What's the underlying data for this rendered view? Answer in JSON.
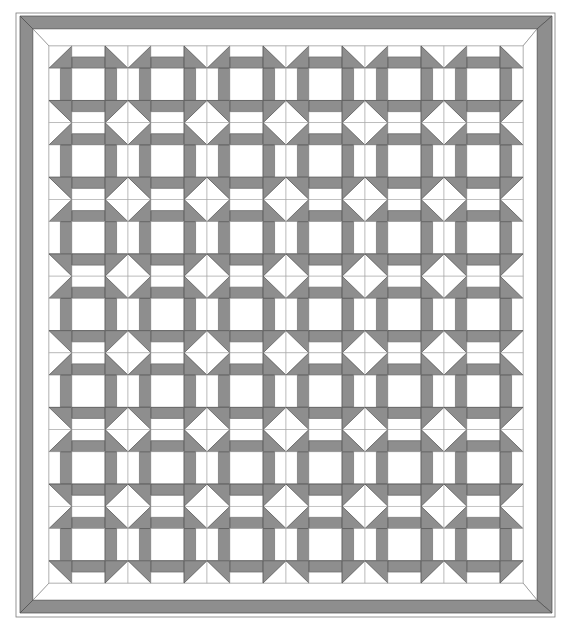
{
  "diagram": {
    "type": "quilt-pattern",
    "block_name": "Churn Dash",
    "blocks_across": 6,
    "blocks_down": 7,
    "colors": {
      "background": "#ffffff",
      "fabric_gray": "#8e8e8e",
      "fabric_white": "#ffffff",
      "piece_outline": "#4a4a4a",
      "seam_line": "#a8a8a8",
      "border_outline": "#7a7a7a"
    },
    "geometry": {
      "outer_frame": {
        "x": 16,
        "y": 13,
        "w": 539,
        "h": 604
      },
      "gray_border": {
        "x0": 20,
        "y0": 16,
        "x1": 552,
        "y1": 613,
        "thickness_x": 13,
        "thickness_y": 13
      },
      "white_border": {
        "x0": 33,
        "y0": 29,
        "x1": 537,
        "y1": 600
      },
      "grid": {
        "x0": 49,
        "y0": 46,
        "x1": 523,
        "y1": 583
      },
      "block_col_fractions": [
        0.29,
        0.42,
        0.29
      ],
      "block_row_fractions": [
        0.29,
        0.42,
        0.29
      ]
    },
    "block_layout": [
      [
        "hst-gray-br",
        "bar-gray-bottom",
        "hst-gray-bl"
      ],
      [
        "bar-gray-right",
        "plain-white",
        "bar-gray-left"
      ],
      [
        "hst-gray-tr",
        "bar-gray-top",
        "hst-gray-tl"
      ]
    ]
  }
}
